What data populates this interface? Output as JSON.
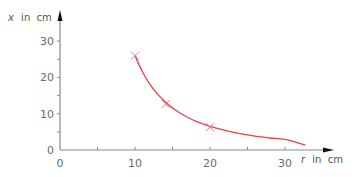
{
  "chart_data": {
    "type": "line",
    "title": "",
    "xlabel": "r in cm",
    "xlabel_var": "r",
    "xlabel_unit": "in  cm",
    "ylabel": "x in cm",
    "ylabel_var": "x",
    "ylabel_unit": "in  cm",
    "xlim": [
      0,
      36
    ],
    "ylim": [
      0,
      37
    ],
    "xticks": [
      0,
      5,
      10,
      15,
      20,
      25,
      30
    ],
    "xtick_labels": [
      "0",
      "",
      "10",
      "",
      "20",
      "",
      "30"
    ],
    "yticks": [
      0,
      5,
      10,
      15,
      20,
      25,
      30
    ],
    "ytick_labels": [
      "0",
      "",
      "10",
      "",
      "20",
      "",
      "30"
    ],
    "grid": false,
    "legend": null,
    "series": [
      {
        "name": "measured points",
        "kind": "markers",
        "marker": "x",
        "x": [
          10,
          14.1,
          20
        ],
        "y": [
          26,
          12.7,
          6.3
        ]
      },
      {
        "name": "fit curve",
        "kind": "line",
        "x": [
          10,
          11,
          12,
          13,
          14,
          15,
          16,
          18,
          20,
          22,
          24,
          26,
          28,
          30,
          32.7
        ],
        "y": [
          26,
          21.5,
          18.1,
          15.4,
          13.3,
          11.6,
          10.2,
          8.0,
          6.5,
          5.4,
          4.5,
          3.8,
          3.3,
          2.9,
          1.4
        ]
      }
    ],
    "colors": {
      "curve": "#e8414c",
      "marker": "#e07a80",
      "axis": "#8a8a8a",
      "arrow": "#111111"
    }
  }
}
